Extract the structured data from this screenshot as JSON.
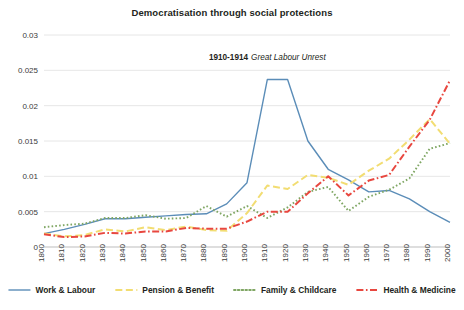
{
  "chart_data": {
    "type": "line",
    "title": "Democratisation through social protections",
    "xlabel": "",
    "ylabel": "",
    "xlim": [
      1800,
      2000
    ],
    "ylim": [
      0,
      0.03
    ],
    "grid": true,
    "legend_position": "bottom",
    "ytick_labels": [
      "0",
      "0.005",
      "0.01",
      "0.015",
      "0.02",
      "0.025",
      "0.03"
    ],
    "ytick_values": [
      0,
      0.005,
      0.01,
      0.015,
      0.02,
      0.025,
      0.03
    ],
    "categories": [
      1800,
      1810,
      1820,
      1830,
      1840,
      1850,
      1860,
      1870,
      1880,
      1890,
      1900,
      1910,
      1920,
      1930,
      1940,
      1950,
      1960,
      1970,
      1980,
      1990,
      2000
    ],
    "xtick_labels": [
      "1800",
      "1810",
      "1820",
      "1830",
      "1840",
      "1850",
      "1860",
      "1870",
      "1880",
      "1890",
      "1900",
      "1910",
      "1920",
      "1930",
      "1940",
      "1950",
      "1960",
      "1970",
      "1980",
      "1990",
      "2000"
    ],
    "series": [
      {
        "name": "Work & Labour",
        "color": "#5b8db8",
        "style": "solid",
        "values": [
          0.0019,
          0.0025,
          0.0032,
          0.004,
          0.004,
          0.0042,
          0.0044,
          0.0046,
          0.0047,
          0.0061,
          0.0091,
          0.0237,
          0.0237,
          0.015,
          0.011,
          0.0095,
          0.0078,
          0.008,
          0.0068,
          0.005,
          0.0035
        ]
      },
      {
        "name": "Pension & Benefit",
        "color": "#f2dd72",
        "style": "dashed",
        "values": [
          0.0019,
          0.0015,
          0.0017,
          0.0025,
          0.0022,
          0.0028,
          0.0024,
          0.0029,
          0.0024,
          0.0023,
          0.0048,
          0.0087,
          0.0082,
          0.0102,
          0.0098,
          0.0088,
          0.0108,
          0.0125,
          0.0152,
          0.0181,
          0.0146
        ]
      },
      {
        "name": "Family & Childcare",
        "color": "#7fa663",
        "style": "dotted",
        "values": [
          0.0028,
          0.0031,
          0.0033,
          0.0041,
          0.0041,
          0.0045,
          0.004,
          0.0041,
          0.0058,
          0.0043,
          0.0058,
          0.0041,
          0.0056,
          0.0078,
          0.0085,
          0.0051,
          0.0071,
          0.0081,
          0.0097,
          0.0139,
          0.0147
        ]
      },
      {
        "name": "Health & Medicine",
        "color": "#e8473f",
        "style": "dashdot",
        "values": [
          0.0018,
          0.0014,
          0.0015,
          0.002,
          0.0019,
          0.0022,
          0.0022,
          0.0027,
          0.0026,
          0.0026,
          0.0036,
          0.005,
          0.005,
          0.0076,
          0.01,
          0.0073,
          0.0094,
          0.0102,
          0.0142,
          0.018,
          0.0236
        ]
      }
    ],
    "annotations": [
      {
        "bold_text": "1910-1914",
        "italic_text": "Great Labour Unrest",
        "x": 1910,
        "y": 0.0265
      }
    ]
  }
}
